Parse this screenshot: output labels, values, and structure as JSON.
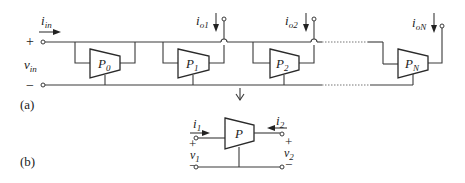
{
  "diagram": {
    "part_a": {
      "caption": "(a)",
      "input_current": {
        "name": "i",
        "sub": "in"
      },
      "input_voltage": {
        "name": "v",
        "sub": "in"
      },
      "plus": "+",
      "minus": "−",
      "blocks": [
        {
          "name": "P",
          "sub": "0"
        },
        {
          "name": "P",
          "sub": "1"
        },
        {
          "name": "P",
          "sub": "2"
        },
        {
          "name": "P",
          "sub": "N"
        }
      ],
      "outputs": [
        {
          "name": "i",
          "sub": "o1"
        },
        {
          "name": "i",
          "sub": "o2"
        },
        {
          "name": "i",
          "sub": "oN"
        }
      ]
    },
    "part_b": {
      "caption": "(b)",
      "block": {
        "name": "P"
      },
      "port1_current": {
        "name": "i",
        "sub": "1"
      },
      "port2_current": {
        "name": "i",
        "sub": "2"
      },
      "port1_voltage": {
        "name": "v",
        "sub": "1"
      },
      "port2_voltage": {
        "name": "v",
        "sub": "2"
      },
      "plus": "+",
      "minus": "−"
    },
    "colors": {
      "line": "#3a3a3a",
      "text": "#222222",
      "background": "#ffffff"
    }
  }
}
